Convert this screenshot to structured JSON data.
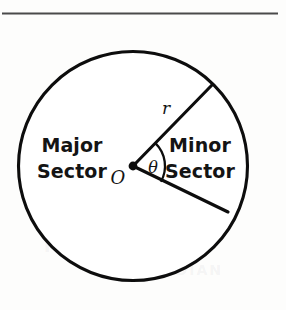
{
  "figure": {
    "kind": "circle-sector-diagram",
    "caption_rule": "horizontal-divider",
    "labels": {
      "major_sector_line1": "Major",
      "major_sector_line2": "Sector",
      "minor_sector_line1": "Minor",
      "minor_sector_line2": "Sector",
      "radius": "r",
      "center": "O",
      "angle": "θ"
    },
    "icons": {
      "center_point": "center-dot-icon"
    },
    "colors": {
      "stroke": "#0d0d0d",
      "rule": "#4a4a4a",
      "fill": "#ffffff",
      "background": "#fdfdfc",
      "text": "#141414"
    }
  },
  "chart_data": {
    "type": "pie",
    "title": "",
    "subtitle": "",
    "xlabel": "",
    "ylabel": "",
    "grid": false,
    "legend": "none",
    "geometry": {
      "center_x": 133,
      "center_y": 166,
      "radius_px": 115,
      "upper_radius_endpoint": [
        212,
        85
      ],
      "lower_radius_endpoint": [
        228,
        212
      ],
      "upper_radius_angle_deg": -45.7,
      "lower_radius_angle_deg": 29.5,
      "angle_arc_radius_px": 32
    },
    "categories": [
      "Minor Sector",
      "Major Sector"
    ],
    "values": [
      75.2,
      284.8
    ],
    "value_unit": "degrees",
    "annotations": [
      {
        "text": "r",
        "role": "radius-label",
        "x": 166,
        "y": 109
      },
      {
        "text": "O",
        "role": "center-label",
        "x": 118,
        "y": 178
      },
      {
        "text": "θ",
        "role": "angle-label",
        "x": 153,
        "y": 168
      },
      {
        "text": "Major Sector",
        "role": "sector-label",
        "x": 72,
        "y": 158
      },
      {
        "text": "Minor Sector",
        "role": "sector-label",
        "x": 198,
        "y": 158
      }
    ]
  },
  "artifacts": {
    "bleed_a": "INVERSE TRIG",
    "bleed_b": "FUNCTIONS",
    "bleed_c": "RADIAN"
  }
}
